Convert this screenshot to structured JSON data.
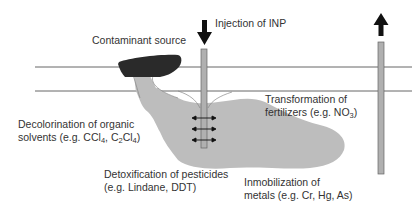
{
  "labels": {
    "contaminant_source": "Contaminant source",
    "injection": "Injection of INP",
    "transformation_line1": "Transformation of",
    "transformation_line2_prefix": "fertilizers (e.g. NO",
    "transformation_sub": "3",
    "transformation_suffix": ")",
    "decolorination_line1": "Decolorination of organic",
    "decolorination_l2_a": "solvents (e.g. CCl",
    "decolorination_l2_sub1": "4",
    "decolorination_l2_b": ", C",
    "decolorination_l2_sub2": "2",
    "decolorination_l2_c": "Cl",
    "decolorination_l2_sub3": "4",
    "decolorination_l2_d": ")",
    "detox_line1": "Detoxification of pesticides",
    "detox_line2": "(e.g. Lindane, DDT)",
    "immob_line1": "Inmobilization of",
    "immob_line2": "metals (e.g. Cr, Hg, As)"
  },
  "colors": {
    "source": "#2a2a2a",
    "plume": "#bdbdbd",
    "well": "#b0b0b0",
    "line": "#555555",
    "arrow": "#111111"
  }
}
